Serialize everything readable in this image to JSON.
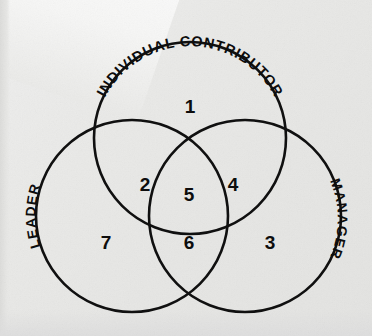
{
  "diagram": {
    "type": "venn-3-circle",
    "title_visible": false,
    "background_color": "#e8e8e6",
    "stroke_color": "#101010",
    "text_color": "#0d0d0d",
    "circles": [
      {
        "id": "individual-contributor",
        "label": "INDIVIDUAL CONTRIBUTOR",
        "cx": 190,
        "cy": 138,
        "r": 96,
        "label_position": "top-arc"
      },
      {
        "id": "leader",
        "label": "LEADER",
        "cx": 132,
        "cy": 216,
        "r": 96,
        "label_position": "left-arc"
      },
      {
        "id": "manager",
        "label": "MANAGER",
        "cx": 245,
        "cy": 216,
        "r": 96,
        "label_position": "right-arc"
      }
    ],
    "regions": [
      {
        "id": "region-1",
        "number": "1",
        "sets": [
          "individual-contributor"
        ],
        "x": 190,
        "y": 108
      },
      {
        "id": "region-2",
        "number": "2",
        "sets": [
          "individual-contributor",
          "leader"
        ],
        "x": 145,
        "y": 186
      },
      {
        "id": "region-3",
        "number": "3",
        "sets": [
          "manager"
        ],
        "x": 270,
        "y": 244
      },
      {
        "id": "region-4",
        "number": "4",
        "sets": [
          "individual-contributor",
          "manager"
        ],
        "x": 233,
        "y": 186
      },
      {
        "id": "region-5",
        "number": "5",
        "sets": [
          "individual-contributor",
          "leader",
          "manager"
        ],
        "x": 189,
        "y": 196
      },
      {
        "id": "region-6",
        "number": "6",
        "sets": [
          "leader",
          "manager"
        ],
        "x": 189,
        "y": 244
      },
      {
        "id": "region-7",
        "number": "7",
        "sets": [
          "leader"
        ],
        "x": 106,
        "y": 244
      }
    ]
  }
}
